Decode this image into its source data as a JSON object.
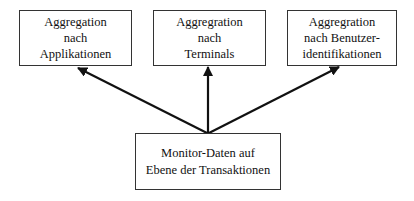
{
  "diagram": {
    "type": "hierarchy",
    "source_node": {
      "id": "monitor-data",
      "lines": [
        "Monitor-Daten auf",
        "Ebene der Transaktionen"
      ]
    },
    "target_nodes": [
      {
        "id": "agg-applications",
        "lines": [
          "Aggregation",
          "nach",
          "Applikationen"
        ]
      },
      {
        "id": "agg-terminals",
        "lines": [
          "Aggregration",
          "nach",
          "Terminals"
        ]
      },
      {
        "id": "agg-user-ids",
        "lines": [
          "Aggregration",
          "nach Benutzer-",
          "identifikationen"
        ]
      }
    ],
    "edges": [
      {
        "from": "monitor-data",
        "to": "agg-applications"
      },
      {
        "from": "monitor-data",
        "to": "agg-terminals"
      },
      {
        "from": "monitor-data",
        "to": "agg-user-ids"
      }
    ],
    "colors": {
      "stroke": "#111111",
      "border": "#333333",
      "background": "#ffffff"
    }
  }
}
